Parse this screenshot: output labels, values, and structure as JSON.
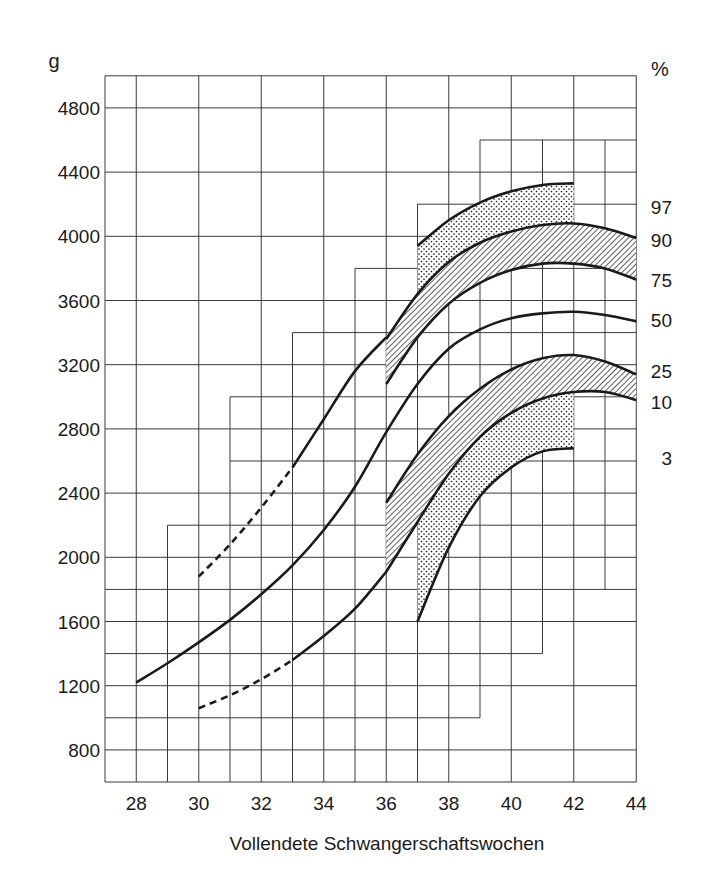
{
  "chart_data": {
    "type": "line",
    "title": "",
    "xlabel": "Vollendete Schwangerschaftswochen",
    "ylabel": "g",
    "right_axis_label": "%",
    "xlim": [
      27,
      44
    ],
    "ylim": [
      600,
      5000
    ],
    "grid": true,
    "x_ticks": [
      28,
      30,
      32,
      34,
      36,
      38,
      40,
      42,
      44
    ],
    "y_ticks": [
      800,
      1200,
      1600,
      2000,
      2400,
      2800,
      3200,
      3600,
      4000,
      4400,
      4800
    ],
    "legend_position": "right (percentile labels at curve ends)",
    "series": [
      {
        "name": "97",
        "style": "dashed then solid",
        "dashed_until": 33,
        "x": [
          30,
          31,
          32,
          33,
          34,
          35,
          36,
          37,
          38,
          39,
          40,
          41,
          42
        ],
        "y": [
          1880,
          2080,
          2310,
          2560,
          2860,
          3160,
          3370,
          3940,
          4100,
          4210,
          4280,
          4320,
          4330
        ]
      },
      {
        "name": "90",
        "style": "solid",
        "x": [
          36,
          37,
          38,
          39,
          40,
          41,
          42,
          43,
          44
        ],
        "y": [
          3360,
          3640,
          3840,
          3960,
          4030,
          4070,
          4080,
          4050,
          3990
        ]
      },
      {
        "name": "75",
        "style": "solid",
        "x": [
          36,
          37,
          38,
          39,
          40,
          41,
          42,
          43,
          44
        ],
        "y": [
          3080,
          3370,
          3580,
          3710,
          3790,
          3830,
          3830,
          3800,
          3730
        ]
      },
      {
        "name": "50",
        "style": "solid",
        "x": [
          28,
          29,
          30,
          31,
          32,
          33,
          34,
          35,
          36,
          37,
          38,
          39,
          40,
          41,
          42,
          43,
          44
        ],
        "y": [
          1220,
          1340,
          1470,
          1610,
          1770,
          1950,
          2170,
          2440,
          2780,
          3080,
          3300,
          3420,
          3490,
          3520,
          3530,
          3510,
          3470
        ]
      },
      {
        "name": "25",
        "style": "solid",
        "x": [
          36,
          37,
          38,
          39,
          40,
          41,
          42,
          43,
          44
        ],
        "y": [
          2340,
          2640,
          2880,
          3050,
          3170,
          3240,
          3260,
          3220,
          3140
        ]
      },
      {
        "name": "10",
        "style": "dashed then solid",
        "dashed_until": 33,
        "x": [
          30,
          31,
          32,
          33,
          34,
          35,
          36,
          37,
          38,
          39,
          40,
          41,
          42,
          43,
          44
        ],
        "y": [
          1060,
          1140,
          1240,
          1360,
          1510,
          1680,
          1910,
          2220,
          2520,
          2750,
          2900,
          2990,
          3030,
          3030,
          2980
        ]
      },
      {
        "name": "3",
        "style": "solid",
        "x": [
          37,
          38,
          39,
          40,
          41,
          42
        ],
        "y": [
          1600,
          2060,
          2380,
          2560,
          2660,
          2680
        ]
      }
    ],
    "shaded_bands": [
      {
        "between": [
          "97",
          "90"
        ],
        "pattern": "dotted",
        "x_range": [
          37,
          42
        ]
      },
      {
        "between": [
          "90",
          "75"
        ],
        "pattern": "hatched",
        "x_range": [
          36,
          44
        ]
      },
      {
        "between": [
          "25",
          "10"
        ],
        "pattern": "hatched",
        "x_range": [
          36,
          44
        ]
      },
      {
        "between": [
          "10",
          "3"
        ],
        "pattern": "dotted",
        "x_range": [
          37,
          42
        ]
      }
    ],
    "annotations": [
      "97",
      "90",
      "75",
      "50",
      "25",
      "10",
      "3"
    ]
  },
  "labels": {
    "y_unit": "g",
    "right_unit": "%",
    "x_axis_title": "Vollendete Schwangerschaftswochen",
    "y_ticks": [
      "4800",
      "4400",
      "4000",
      "3600",
      "3200",
      "2800",
      "2400",
      "2000",
      "1600",
      "1200",
      "800"
    ],
    "x_ticks": [
      "28",
      "30",
      "32",
      "34",
      "36",
      "38",
      "40",
      "42",
      "44"
    ],
    "percentiles": [
      {
        "label": "97",
        "y": 4180
      },
      {
        "label": "90",
        "y": 3980
      },
      {
        "label": "75",
        "y": 3730
      },
      {
        "label": "50",
        "y": 3480
      },
      {
        "label": "25",
        "y": 3160
      },
      {
        "label": "10",
        "y": 2970
      },
      {
        "label": "3",
        "y": 2620
      }
    ]
  },
  "colors": {
    "ink": "#1a1a1a",
    "grid": "#3a3a3a",
    "background": "#ffffff"
  }
}
